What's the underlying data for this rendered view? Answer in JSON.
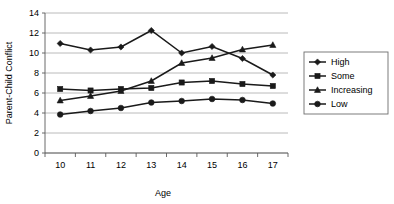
{
  "chart_data": {
    "type": "line",
    "title": "",
    "xlabel": "Age",
    "ylabel": "Parent-Child Conflict",
    "categories": [
      10,
      11,
      12,
      13,
      14,
      15,
      16,
      17
    ],
    "xtick_labels": [
      "10",
      "11",
      "12",
      "13",
      "14",
      "15",
      "16",
      "17"
    ],
    "ytick_labels": [
      "0",
      "2",
      "4",
      "6",
      "8",
      "10",
      "12",
      "14"
    ],
    "yticks": [
      0,
      2,
      4,
      6,
      8,
      10,
      12,
      14
    ],
    "ylim": [
      0,
      14
    ],
    "grid": "horizontal",
    "legend_position": "right",
    "series": [
      {
        "name": "High",
        "marker": "diamond",
        "values": [
          10.95,
          10.3,
          10.6,
          12.25,
          10.0,
          10.65,
          9.45,
          7.8
        ]
      },
      {
        "name": "Some",
        "marker": "square",
        "values": [
          6.4,
          6.25,
          6.4,
          6.5,
          7.05,
          7.2,
          6.9,
          6.7
        ]
      },
      {
        "name": "Increasing",
        "marker": "triangle",
        "values": [
          5.25,
          5.7,
          6.2,
          7.2,
          9.0,
          9.5,
          10.35,
          10.8
        ]
      },
      {
        "name": "Low",
        "marker": "circle",
        "values": [
          3.85,
          4.2,
          4.5,
          5.05,
          5.2,
          5.4,
          5.3,
          4.95
        ]
      }
    ]
  },
  "legend": {
    "entries": [
      "High",
      "Some",
      "Increasing",
      "Low"
    ]
  },
  "colors": {
    "series": "#1a1a1a",
    "grid": "#a8a8a8",
    "axis": "#5a5a5a",
    "background": "#ffffff"
  }
}
